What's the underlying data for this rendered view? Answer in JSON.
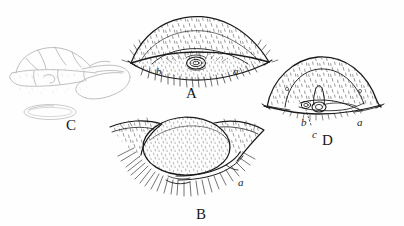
{
  "plate": {
    "title": "Comparative anatomical plate of eyelid and ocular structures",
    "background_color": "#fefefe",
    "ink_color": "#1b1b1b",
    "faint_ink_color": "#b9b9b9",
    "medium": "engraved line drawing with stipple and hatching",
    "figures": [
      {
        "id": "A",
        "label": "A",
        "caption": "Open eye seen from front, lids retracted, showing central ocular aperture",
        "label_x": 186,
        "label_y": 86,
        "references": [
          {
            "letter": "b",
            "x": 156,
            "y": 66,
            "side": "left"
          },
          {
            "letter": "a",
            "x": 233,
            "y": 66,
            "side": "right"
          }
        ]
      },
      {
        "id": "B",
        "label": "B",
        "caption": "Closed eye with prominent radiating lashes along lower margin",
        "label_x": 196,
        "label_y": 207,
        "references": [
          {
            "letter": "a",
            "x": 238,
            "y": 177,
            "side": "right"
          }
        ]
      },
      {
        "id": "C",
        "label": "C",
        "caption": "Faint outline drawing of curved hook-like process with adjacent oval body",
        "label_x": 66,
        "label_y": 118,
        "references": []
      },
      {
        "id": "D",
        "label": "D",
        "caption": "Dome-shaped eye in profile showing nictitating structures at base",
        "label_x": 322,
        "label_y": 133,
        "references": [
          {
            "letter": "b",
            "x": 301,
            "y": 117,
            "side": "left"
          },
          {
            "letter": "c",
            "x": 312,
            "y": 129,
            "side": "below"
          },
          {
            "letter": "a",
            "x": 357,
            "y": 117,
            "side": "right"
          }
        ]
      }
    ]
  }
}
